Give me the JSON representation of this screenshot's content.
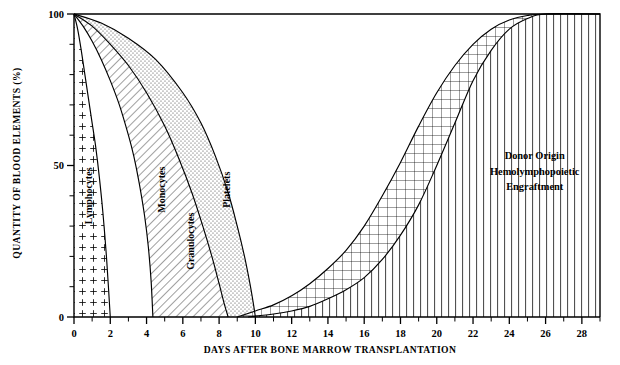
{
  "chart_data": {
    "type": "area",
    "title": "",
    "xlabel": "DAYS AFTER BONE MARROW TRANSPLANTATION",
    "ylabel": "QUANTITY OF BLOOD ELEMENTS (%)",
    "xlim": [
      0,
      29
    ],
    "ylim": [
      0,
      100
    ],
    "grid": false,
    "legend_position": "inline-band-labels",
    "x_major_ticks": [
      0,
      2,
      4,
      6,
      8,
      10,
      12,
      14,
      16,
      18,
      20,
      22,
      24,
      26,
      28
    ],
    "x_major_tick_labels": [
      "0",
      "2",
      "4",
      "6",
      "8",
      "10",
      "12",
      "14",
      "16",
      "18",
      "20",
      "22",
      "24",
      "26",
      "28"
    ],
    "x_minor_tick_step": 1,
    "y_major_ticks": [
      0,
      50,
      100
    ],
    "y_major_tick_labels": [
      "0",
      "50",
      "100"
    ],
    "y_minor_tick_step": 10,
    "series": [
      {
        "name": "Lymphocytes",
        "fill": "plus-pattern",
        "label": "Lymphocytes",
        "description": "Recipient lymphocyte decline after conditioning",
        "points": [
          [
            0,
            100
          ],
          [
            0.2,
            95
          ],
          [
            0.4,
            88
          ],
          [
            0.6,
            80
          ],
          [
            0.8,
            72
          ],
          [
            1.0,
            64
          ],
          [
            1.2,
            56
          ],
          [
            1.4,
            46
          ],
          [
            1.6,
            34
          ],
          [
            1.8,
            19
          ],
          [
            2.0,
            0
          ]
        ]
      },
      {
        "name": "Monocytes",
        "fill": "diagonal-hatch",
        "label": "Monocytes",
        "description": "Recipient monocyte decline after conditioning",
        "points": [
          [
            0,
            100
          ],
          [
            0.5,
            96
          ],
          [
            1.0,
            91
          ],
          [
            1.5,
            85
          ],
          [
            2.0,
            78
          ],
          [
            2.5,
            70
          ],
          [
            3.0,
            60
          ],
          [
            3.3,
            53
          ],
          [
            3.6,
            44
          ],
          [
            3.9,
            33
          ],
          [
            4.1,
            23
          ],
          [
            4.25,
            12
          ],
          [
            4.35,
            0
          ]
        ]
      },
      {
        "name": "Granulocytes",
        "fill": "diagonal-hatch",
        "label": "Granulocytes",
        "description": "Recipient granulocyte decline after conditioning",
        "points": [
          [
            0,
            100
          ],
          [
            1.0,
            96
          ],
          [
            2.0,
            90
          ],
          [
            3.0,
            83
          ],
          [
            4.0,
            74
          ],
          [
            5.0,
            63
          ],
          [
            5.8,
            52
          ],
          [
            6.5,
            41
          ],
          [
            7.1,
            30
          ],
          [
            7.6,
            20
          ],
          [
            8.0,
            11
          ],
          [
            8.3,
            4
          ],
          [
            8.5,
            0
          ]
        ]
      },
      {
        "name": "Platelets",
        "fill": "stipple-dots",
        "label": "Platelets",
        "description": "Recipient platelet decline after conditioning",
        "points": [
          [
            0,
            100
          ],
          [
            1.5,
            97
          ],
          [
            3.0,
            92
          ],
          [
            4.5,
            85
          ],
          [
            6.0,
            74
          ],
          [
            7.0,
            64
          ],
          [
            7.8,
            53
          ],
          [
            8.5,
            41
          ],
          [
            9.0,
            30
          ],
          [
            9.4,
            20
          ],
          [
            9.7,
            11
          ],
          [
            9.9,
            4
          ],
          [
            10.0,
            0
          ]
        ]
      },
      {
        "name": "Donor Origin Hemolymphopoietic Engraftment (upper)",
        "fill": "cross-hatch",
        "label": "",
        "description": "Leading edge of donor-derived engraftment recovery",
        "points": [
          [
            9.0,
            0
          ],
          [
            10.0,
            2
          ],
          [
            11.0,
            4
          ],
          [
            12.0,
            7
          ],
          [
            13.0,
            11
          ],
          [
            14.0,
            16
          ],
          [
            15.0,
            22
          ],
          [
            16.0,
            30
          ],
          [
            17.0,
            40
          ],
          [
            18.0,
            51
          ],
          [
            19.0,
            63
          ],
          [
            20.0,
            74
          ],
          [
            21.0,
            83
          ],
          [
            22.0,
            90
          ],
          [
            23.0,
            95
          ],
          [
            24.0,
            98
          ],
          [
            25.0,
            99.5
          ],
          [
            26.0,
            100
          ],
          [
            29.0,
            100
          ]
        ]
      },
      {
        "name": "Donor Origin Hemolymphopoietic Engraftment (lower)",
        "fill": "vertical-lines",
        "label": "Donor Origin Hemolymphopoietic Engraftment",
        "description": "Trailing edge of donor-derived engraftment recovery",
        "points": [
          [
            9.6,
            0
          ],
          [
            11.0,
            1
          ],
          [
            12.0,
            2
          ],
          [
            13.0,
            3.5
          ],
          [
            14.0,
            6
          ],
          [
            15.0,
            9
          ],
          [
            16.0,
            13
          ],
          [
            17.0,
            19
          ],
          [
            18.0,
            27
          ],
          [
            19.0,
            37
          ],
          [
            20.0,
            50
          ],
          [
            21.0,
            64
          ],
          [
            22.0,
            78
          ],
          [
            23.0,
            88
          ],
          [
            24.0,
            95
          ],
          [
            25.0,
            98.5
          ],
          [
            26.0,
            100
          ],
          [
            29.0,
            100
          ]
        ]
      }
    ],
    "annotations": [
      {
        "text": "Lymphocytes",
        "x": 1.0,
        "y": 40,
        "rotation": -90
      },
      {
        "text": "Monocytes",
        "x": 5.0,
        "y": 42,
        "rotation": -90
      },
      {
        "text": "Granulocytes",
        "x": 6.6,
        "y": 25,
        "rotation": -90
      },
      {
        "text": "Platelets",
        "x": 8.6,
        "y": 42,
        "rotation": -90
      },
      {
        "text": "Donor Origin",
        "x": 25.4,
        "y": 52,
        "rotation": 0
      },
      {
        "text": "Hemolymphopoietic",
        "x": 25.4,
        "y": 47,
        "rotation": 0
      },
      {
        "text": "Engraftment",
        "x": 25.4,
        "y": 42,
        "rotation": 0
      }
    ]
  },
  "labels": {
    "y_axis_title": "QUANTITY OF BLOOD ELEMENTS (%)",
    "x_axis_title": "DAYS AFTER BONE MARROW TRANSPLANTATION",
    "lymphocytes": "Lymphocytes",
    "monocytes": "Monocytes",
    "granulocytes": "Granulocytes",
    "platelets": "Platelets",
    "donor_line1": "Donor Origin",
    "donor_line2": "Hemolymphopoietic",
    "donor_line3": "Engraftment",
    "y0": "0",
    "y50": "50",
    "y100": "100"
  },
  "colors": {
    "ink": "#000000",
    "background": "#ffffff"
  }
}
